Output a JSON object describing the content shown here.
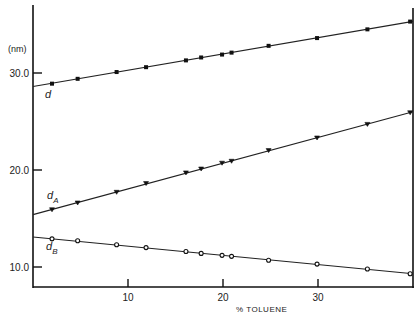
{
  "chart_data": {
    "type": "line",
    "title": "",
    "xlabel": "% TOLUENE",
    "ylabel": "(nm)",
    "xlim": [
      0,
      40
    ],
    "ylim": [
      8,
      37
    ],
    "x_ticks": [
      10,
      20,
      30
    ],
    "x_tick_labels": [
      "10",
      "20",
      "30"
    ],
    "y_ticks": [
      10,
      20,
      30
    ],
    "y_tick_labels": [
      "10.0",
      "20.0",
      "30.0"
    ],
    "grid": false,
    "legend": "inline labels",
    "x": [
      2.0,
      4.7,
      8.8,
      11.9,
      16.1,
      17.7,
      19.9,
      20.9,
      24.8,
      29.9,
      35.2,
      39.7
    ],
    "series": [
      {
        "name": "d",
        "label": "d",
        "marker": "filled-square",
        "fit": {
          "intercept": 28.6,
          "slope": 0.168
        },
        "values": [
          28.9,
          29.4,
          30.1,
          30.6,
          31.3,
          31.6,
          31.9,
          32.1,
          32.8,
          33.6,
          34.5,
          35.3
        ]
      },
      {
        "name": "dA",
        "label": "d",
        "subscript": "A",
        "marker": "triangle",
        "fit": {
          "intercept": 15.4,
          "slope": 0.265
        },
        "values": [
          15.9,
          16.6,
          17.7,
          18.6,
          19.7,
          20.1,
          20.7,
          20.9,
          22.0,
          23.3,
          24.7,
          25.9
        ]
      },
      {
        "name": "dB",
        "label": "d",
        "subscript": "B",
        "marker": "open-circle",
        "fit": {
          "intercept": 13.1,
          "slope": -0.095
        },
        "values": [
          12.9,
          12.7,
          12.3,
          12.0,
          11.6,
          11.4,
          11.2,
          11.1,
          10.7,
          10.3,
          9.8,
          9.3
        ]
      }
    ]
  }
}
